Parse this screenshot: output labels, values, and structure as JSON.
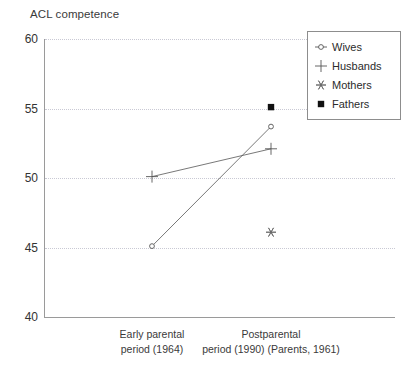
{
  "chart_data": {
    "type": "line",
    "title": "",
    "ylabel": "ACL competence",
    "xlabel": "",
    "ylim": [
      40,
      60
    ],
    "yticks": [
      40,
      45,
      50,
      55,
      60
    ],
    "grid": "horizontal-dotted",
    "legend_position": "top-right",
    "categories": [
      "Early parental period (1964)",
      "Postparental period (1990) (Parents, 1961)"
    ],
    "category_lines": [
      [
        "Early parental",
        "period (1964)"
      ],
      [
        "Postparental",
        "period (1990) (Parents, 1961)"
      ]
    ],
    "series": [
      {
        "name": "Wives",
        "marker": "circle-open",
        "connected": true,
        "values": [
          45.1,
          53.7
        ]
      },
      {
        "name": "Husbands",
        "marker": "plus",
        "connected": true,
        "values": [
          50.1,
          52.1
        ]
      },
      {
        "name": "Mothers",
        "marker": "asterisk",
        "connected": false,
        "values": [
          null,
          46.1
        ]
      },
      {
        "name": "Fathers",
        "marker": "square-filled",
        "connected": false,
        "values": [
          null,
          55.1
        ]
      }
    ]
  },
  "axis": {
    "ylabel_text": "ACL competence",
    "ytick_labels": [
      "60",
      "55",
      "50",
      "45",
      "40"
    ]
  },
  "legend": {
    "entries": [
      {
        "label": "Wives",
        "marker": "circle-open-icon"
      },
      {
        "label": "Husbands",
        "marker": "plus-icon"
      },
      {
        "label": "Mothers",
        "marker": "asterisk-icon"
      },
      {
        "label": "Fathers",
        "marker": "square-filled-icon"
      }
    ]
  },
  "colors": {
    "axis": "#9a9a9a",
    "grid": "#c9c9d4",
    "series": "#555555",
    "text": "#2b2b2b"
  }
}
